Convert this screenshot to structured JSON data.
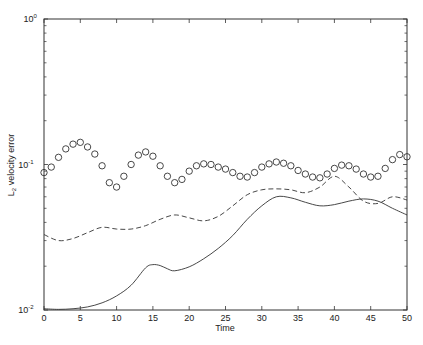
{
  "chart_data": {
    "type": "line",
    "title": "",
    "xlabel": "Time",
    "ylabel": "L_2 velocity error",
    "ylabel_parts": {
      "main": "L",
      "sub": "2",
      "rest": " velocity error"
    },
    "xscale": "linear",
    "yscale": "log",
    "xlim": [
      0,
      50
    ],
    "ylim": [
      0.01,
      1
    ],
    "grid": false,
    "legend": null,
    "x_ticks": [
      0,
      5,
      10,
      15,
      20,
      25,
      30,
      35,
      40,
      45,
      50
    ],
    "x_tick_labels": [
      "0",
      "5",
      "10",
      "15",
      "20",
      "25",
      "30",
      "35",
      "40",
      "45",
      "50"
    ],
    "y_ticks": [
      0.01,
      0.1,
      1
    ],
    "y_tick_labels": [
      {
        "base": "10",
        "exp": "-2"
      },
      {
        "base": "10",
        "exp": "-1"
      },
      {
        "base": "10",
        "exp": "0"
      }
    ],
    "series": [
      {
        "name": "circles",
        "style": "markers-circle",
        "x": [
          0,
          1,
          2,
          3,
          4,
          5,
          6,
          7,
          8,
          9,
          10,
          11,
          12,
          13,
          14,
          15,
          16,
          17,
          18,
          19,
          20,
          21,
          22,
          23,
          24,
          25,
          26,
          27,
          28,
          29,
          30,
          31,
          32,
          33,
          34,
          35,
          36,
          37,
          38,
          39,
          40,
          41,
          42,
          43,
          44,
          45,
          46,
          47,
          48,
          49,
          50
        ],
        "y": [
          0.088,
          0.096,
          0.112,
          0.128,
          0.138,
          0.142,
          0.132,
          0.118,
          0.098,
          0.075,
          0.07,
          0.083,
          0.1,
          0.116,
          0.122,
          0.114,
          0.098,
          0.083,
          0.075,
          0.079,
          0.09,
          0.098,
          0.101,
          0.1,
          0.096,
          0.093,
          0.088,
          0.083,
          0.082,
          0.088,
          0.096,
          0.101,
          0.104,
          0.102,
          0.098,
          0.091,
          0.086,
          0.082,
          0.081,
          0.086,
          0.094,
          0.099,
          0.098,
          0.093,
          0.086,
          0.082,
          0.083,
          0.094,
          0.108,
          0.117,
          0.113
        ]
      },
      {
        "name": "dashed",
        "style": "dashed",
        "x": [
          0,
          2,
          4,
          6,
          8,
          10,
          12,
          14,
          16,
          18,
          20,
          22,
          24,
          26,
          28,
          30,
          32,
          34,
          36,
          38,
          40,
          42,
          44,
          46,
          48,
          50
        ],
        "y": [
          0.033,
          0.03,
          0.031,
          0.034,
          0.037,
          0.036,
          0.036,
          0.038,
          0.042,
          0.045,
          0.043,
          0.041,
          0.044,
          0.052,
          0.062,
          0.067,
          0.068,
          0.067,
          0.064,
          0.07,
          0.083,
          0.07,
          0.056,
          0.054,
          0.06,
          0.057
        ]
      },
      {
        "name": "solid",
        "style": "solid",
        "x": [
          0,
          2,
          4,
          6,
          8,
          10,
          12,
          14,
          15,
          16,
          17,
          18,
          20,
          22,
          24,
          26,
          28,
          30,
          32,
          34,
          36,
          38,
          40,
          42,
          44,
          46,
          48,
          50
        ],
        "y": [
          0.0102,
          0.0101,
          0.0102,
          0.0105,
          0.0112,
          0.0125,
          0.0148,
          0.0195,
          0.0205,
          0.0202,
          0.0192,
          0.0186,
          0.0198,
          0.0225,
          0.0265,
          0.0325,
          0.042,
          0.052,
          0.06,
          0.059,
          0.055,
          0.052,
          0.053,
          0.056,
          0.058,
          0.056,
          0.05,
          0.045
        ]
      }
    ],
    "colors": {
      "line": "#333333",
      "axis": "#222222"
    }
  }
}
